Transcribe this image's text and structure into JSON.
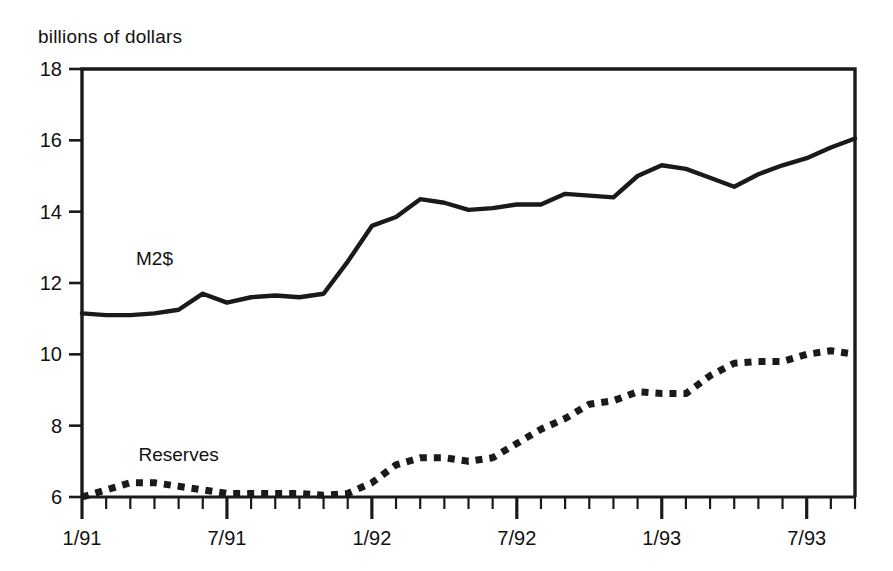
{
  "chart_data": {
    "type": "line",
    "title": "",
    "subtitle": "",
    "ylabel": "billions of dollars",
    "xlabel": "",
    "ylim": [
      6,
      18
    ],
    "yticks": [
      6,
      8,
      10,
      12,
      14,
      16,
      18
    ],
    "ytick_labels": [
      "6",
      "8",
      "10",
      "12",
      "14",
      "16",
      "18"
    ],
    "xtick_labels": [
      "1/91",
      "7/91",
      "1/92",
      "7/92",
      "1/93",
      "7/93"
    ],
    "xtick_major_indices": [
      0,
      6,
      12,
      18,
      24,
      30
    ],
    "x_minor_tick_count": 33,
    "grid": false,
    "legend_position": "inline-annotation",
    "x": [
      "1/91",
      "2/91",
      "3/91",
      "4/91",
      "5/91",
      "6/91",
      "7/91",
      "8/91",
      "9/91",
      "10/91",
      "11/91",
      "12/91",
      "1/92",
      "2/92",
      "3/92",
      "4/92",
      "5/92",
      "6/92",
      "7/92",
      "8/92",
      "9/92",
      "10/92",
      "11/92",
      "12/92",
      "1/93",
      "2/93",
      "3/93",
      "4/93",
      "5/93",
      "6/93",
      "7/93",
      "8/93",
      "9/93"
    ],
    "series": [
      {
        "name": "M2$",
        "style": "solid",
        "color": "#1a1a1a",
        "label_x": "4/91",
        "label_y": 12.5,
        "values": [
          11.15,
          11.1,
          11.1,
          11.15,
          11.25,
          11.7,
          11.45,
          11.6,
          11.65,
          11.6,
          11.7,
          12.6,
          13.6,
          13.85,
          14.35,
          14.25,
          14.05,
          14.1,
          14.2,
          14.2,
          14.5,
          14.45,
          14.4,
          15.0,
          15.3,
          15.2,
          14.95,
          14.7,
          15.05,
          15.3,
          15.5,
          15.8,
          16.05
        ]
      },
      {
        "name": "Reserves",
        "style": "dotted",
        "color": "#1a1a1a",
        "label_x": "5/91",
        "label_y": 7.0,
        "values": [
          6.0,
          6.2,
          6.4,
          6.4,
          6.3,
          6.2,
          6.1,
          6.1,
          6.1,
          6.1,
          6.05,
          6.1,
          6.4,
          6.9,
          7.1,
          7.1,
          7.0,
          7.1,
          7.5,
          7.9,
          8.2,
          8.6,
          8.7,
          8.95,
          8.9,
          8.9,
          9.4,
          9.75,
          9.8,
          9.8,
          10.0,
          10.1,
          10.0
        ]
      }
    ]
  },
  "annotations": {
    "m2_label": "M2$",
    "reserves_label": "Reserves"
  }
}
